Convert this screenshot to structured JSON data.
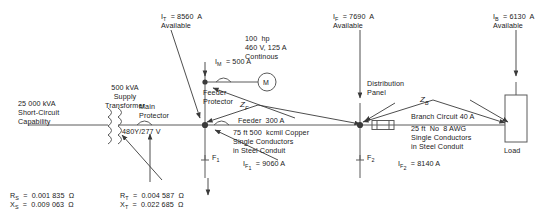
{
  "labels": {
    "source_kva": "25 000 kVA",
    "source_line2": "Short-Circuit",
    "source_line3": "Capability",
    "transformer_l1": "500 kVA",
    "transformer_l2": "Supply",
    "transformer_l3": "Transformer",
    "secondary_voltage": "480Y/277 V",
    "main_protector_l1": "Main",
    "main_protector_l2": "Protector",
    "feeder_protector_l1": "Feeder",
    "feeder_protector_l2": "Protector",
    "it_available_l1": "I_T  =  8560  A",
    "it_available_l2": "Available",
    "im_current": "I_M  =  500 A",
    "motor_l1": "100  hp",
    "motor_l2": "460 V, 125 A",
    "motor_l3": "Continous",
    "motor_symbol": "M",
    "zf_symbol": "Z_F",
    "feeder_rating": "Feeder  300 A",
    "feeder_cable_l1": "75 ft 500  kcmil Copper",
    "feeder_cable_l2": "Single Conductors",
    "feeder_cable_l3": "in Steel Conduit",
    "if_available_l1": "I_F  =  7690  A",
    "if_available_l2": "Available",
    "dist_panel_l1": "Distribution",
    "dist_panel_l2": "Panel",
    "zb_symbol": "Z_B",
    "branch_rating": "Branch Circuit 40 A",
    "branch_cable_l1": "25 ft  No  8 AWG",
    "branch_cable_l2": "Single Conductors",
    "branch_cable_l3": "in Steel Conduit",
    "ib_available_l1": "I_B  =  6130  A",
    "ib_available_l2": "Available",
    "load": "Load",
    "fault1": "F_1",
    "fault2": "F_2",
    "if1_value": "I_F1  =  9060 A",
    "if2_value": "I_F2  =  8140 A",
    "rs_value": "R_S  =  0.001 835  Ω",
    "xs_value": "X_S  =  0.009 063  Ω",
    "rt_value": "R_T  =  0.004 587  Ω",
    "xt_value": "X_T  =  0.022 685  Ω"
  },
  "diagram_data": {
    "type": "one-line-electrical-schematic",
    "source": {
      "available_short_circuit_kva": 25000,
      "resistance_ohm": 0.001835,
      "reactance_ohm": 0.009063
    },
    "transformer": {
      "rating_kva": 500,
      "secondary_voltage": "480Y/277 V",
      "resistance_ohm": 0.004587,
      "reactance_ohm": 0.022685
    },
    "currents_available_amps": {
      "transformer_secondary_IT": 8560,
      "feeder_end_IF": 7690,
      "branch_end_IB": 6130
    },
    "fault_currents_amps": {
      "F1": 9060,
      "F2": 8140
    },
    "motor_branch": {
      "current_IM_amps": 500,
      "horsepower": 100,
      "voltage": 460,
      "full_load_amps": 125,
      "duty": "Continous"
    },
    "feeder": {
      "rating_amps": 300,
      "length_ft": 75,
      "conductor": "500 kcmil Copper",
      "arrangement": "Single Conductors in Steel Conduit",
      "impedance_symbol": "Z_F"
    },
    "branch_circuit": {
      "rating_amps": 40,
      "length_ft": 25,
      "conductor": "No 8 AWG",
      "arrangement": "Single Conductors in Steel Conduit",
      "impedance_symbol": "Z_B"
    },
    "colors": {
      "line": "#3a3a3a",
      "text": "#1a1a1a",
      "background": "#ffffff"
    }
  }
}
